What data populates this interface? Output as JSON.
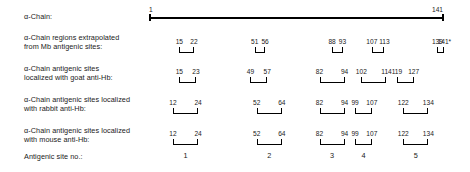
{
  "figure": {
    "scale": {
      "start_residue": 1,
      "end_residue": 141,
      "start_label": "1",
      "end_label": "141",
      "x_start_px": 150,
      "x_end_px": 443
    },
    "rows": [
      {
        "id": "alpha-chain",
        "label": "α-Chain:",
        "label_top": 12,
        "track_top": 6,
        "type": "axis"
      },
      {
        "id": "mb-extrapolated",
        "label": "α-Chain regions extrapolated\nfrom Mb antigenic sites:",
        "label_top": 33,
        "track_top": 36,
        "type": "brackets",
        "segments": [
          {
            "start": 15,
            "end": 22,
            "start_label": "15",
            "end_label": "22"
          },
          {
            "start": 51,
            "end": 56,
            "start_label": "51",
            "end_label": "56"
          },
          {
            "start": 88,
            "end": 93,
            "start_label": "88",
            "end_label": "93"
          },
          {
            "start": 107,
            "end": 113,
            "start_label": "107",
            "end_label": "113"
          },
          {
            "start": 139,
            "end": 141,
            "start_label": "139",
            "end_label": "141*"
          }
        ]
      },
      {
        "id": "goat-anti-hb",
        "label": "α-Chain antigenic sites\nlocalized with goat anti-Hb:",
        "label_top": 64,
        "track_top": 66,
        "type": "brackets",
        "segments": [
          {
            "start": 15,
            "end": 23,
            "start_label": "15",
            "end_label": "23"
          },
          {
            "start": 49,
            "end": 57,
            "start_label": "49",
            "end_label": "57"
          },
          {
            "start": 82,
            "end": 94,
            "start_label": "82",
            "end_label": "94"
          },
          {
            "start": 102,
            "end": 114,
            "start_label": "102",
            "end_label": "114"
          },
          {
            "start": 119,
            "end": 127,
            "start_label": "119",
            "end_label": "127"
          }
        ]
      },
      {
        "id": "rabbit-anti-hb",
        "label": "α-Chain antigenic sites localized\nwith rabbit anti-Hb:",
        "label_top": 95,
        "track_top": 97,
        "type": "brackets",
        "segments": [
          {
            "start": 12,
            "end": 24,
            "start_label": "12",
            "end_label": "24"
          },
          {
            "start": 52,
            "end": 64,
            "start_label": "52",
            "end_label": "64"
          },
          {
            "start": 82,
            "end": 94,
            "start_label": "82",
            "end_label": "94"
          },
          {
            "start": 99,
            "end": 107,
            "start_label": "99",
            "end_label": "107"
          },
          {
            "start": 122,
            "end": 134,
            "start_label": "122",
            "end_label": "134"
          }
        ]
      },
      {
        "id": "mouse-anti-hb",
        "label": "α-Chain antigenic sites localized\nwith mouse anti-Hb:",
        "label_top": 126,
        "track_top": 128,
        "type": "brackets",
        "segments": [
          {
            "start": 12,
            "end": 24,
            "start_label": "12",
            "end_label": "24"
          },
          {
            "start": 52,
            "end": 64,
            "start_label": "52",
            "end_label": "64"
          },
          {
            "start": 82,
            "end": 94,
            "start_label": "82",
            "end_label": "94"
          },
          {
            "start": 99,
            "end": 107,
            "start_label": "99",
            "end_label": "107"
          },
          {
            "start": 122,
            "end": 134,
            "start_label": "122",
            "end_label": "134"
          }
        ]
      },
      {
        "id": "antigenic-site-no",
        "label": "Antigenic site no.:",
        "label_top": 152,
        "track_top": 150,
        "type": "site-numbers",
        "sites": [
          {
            "label": "1",
            "center_residue": 18
          },
          {
            "label": "2",
            "center_residue": 58
          },
          {
            "label": "3",
            "center_residue": 88
          },
          {
            "label": "4",
            "center_residue": 103
          },
          {
            "label": "5",
            "center_residue": 128
          }
        ]
      }
    ]
  },
  "chart_data": {
    "type": "table",
    "title": "α-Chain antigenic sites",
    "xlabel": "Residue number",
    "ylabel": "",
    "xlim": [
      1,
      141
    ],
    "grid": false,
    "legend": "none",
    "axis_ticks": [
      "1",
      "141"
    ],
    "series": [
      {
        "name": "α-Chain regions extrapolated from Mb antigenic sites",
        "segments": [
          [
            15,
            22
          ],
          [
            51,
            56
          ],
          [
            88,
            93
          ],
          [
            107,
            113
          ],
          [
            139,
            141
          ]
        ],
        "notes": "139-141 marked with asterisk"
      },
      {
        "name": "α-Chain antigenic sites localized with goat anti-Hb",
        "segments": [
          [
            15,
            23
          ],
          [
            49,
            57
          ],
          [
            82,
            94
          ],
          [
            102,
            114
          ],
          [
            119,
            127
          ]
        ]
      },
      {
        "name": "α-Chain antigenic sites localized with rabbit anti-Hb",
        "segments": [
          [
            12,
            24
          ],
          [
            52,
            64
          ],
          [
            82,
            94
          ],
          [
            99,
            107
          ],
          [
            122,
            134
          ]
        ]
      },
      {
        "name": "α-Chain antigenic sites localized with mouse anti-Hb",
        "segments": [
          [
            12,
            24
          ],
          [
            52,
            64
          ],
          [
            82,
            94
          ],
          [
            99,
            107
          ],
          [
            122,
            134
          ]
        ]
      }
    ],
    "antigenic_site_numbers": [
      "1",
      "2",
      "3",
      "4",
      "5"
    ]
  }
}
